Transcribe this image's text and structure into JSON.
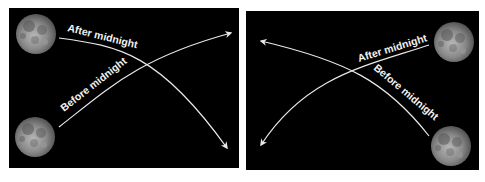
{
  "diagram": {
    "background_color": "#ffffff",
    "panel_color": "#000000",
    "line_color": "#e8e8e8",
    "panels": [
      {
        "id": "left",
        "description": "Moon paths viewed with moons rising on the left",
        "moons": [
          {
            "position": "top-left"
          },
          {
            "position": "bottom-left"
          }
        ],
        "paths": [
          {
            "label": "After midnight",
            "from": "top-left moon",
            "to": "bottom-right arrow"
          },
          {
            "label": "Before midnight",
            "from": "bottom-left moon",
            "to": "top-right arrow"
          }
        ]
      },
      {
        "id": "right",
        "description": "Moon paths viewed with moons on the right",
        "moons": [
          {
            "position": "top-right"
          },
          {
            "position": "bottom-right"
          }
        ],
        "paths": [
          {
            "label": "After midnight",
            "from": "top-right moon",
            "to": "bottom-left arrow"
          },
          {
            "label": "Before midnight",
            "from": "bottom-right moon",
            "to": "top-left arrow"
          }
        ]
      }
    ]
  },
  "labels": {
    "left_after": "After midnight",
    "left_before": "Before midnight",
    "right_after": "After midnight",
    "right_before": "Before midnight"
  }
}
